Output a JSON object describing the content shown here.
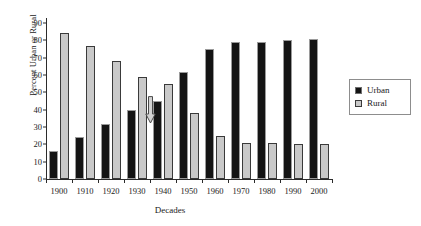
{
  "chart_data": {
    "type": "bar",
    "title": "",
    "xlabel": "Decades",
    "ylabel": "Percent Urban or Rural",
    "categories": [
      "1900",
      "1910",
      "1920",
      "1930",
      "1940",
      "1950",
      "1960",
      "1970",
      "1980",
      "1990",
      "2000"
    ],
    "series": [
      {
        "name": "Urban",
        "color": "#141414",
        "values": [
          16,
          24,
          32,
          40,
          45,
          62,
          75,
          79,
          79,
          80,
          81
        ]
      },
      {
        "name": "Rural",
        "color": "#c9c9c9",
        "values": [
          84,
          77,
          68,
          59,
          55,
          38,
          25,
          21,
          21,
          20,
          20
        ]
      }
    ],
    "ylim": [
      0,
      90
    ],
    "yticks": [
      0,
      10,
      20,
      30,
      40,
      50,
      60,
      70,
      80,
      90
    ],
    "grid": false,
    "legend_position": "right"
  },
  "legend": {
    "items": [
      {
        "label": "Urban"
      },
      {
        "label": "Rural"
      }
    ]
  },
  "annotations": [
    {
      "name": "down-arrow",
      "shape": "down-arrow",
      "x_category": "1935",
      "y_value": 48
    }
  ]
}
